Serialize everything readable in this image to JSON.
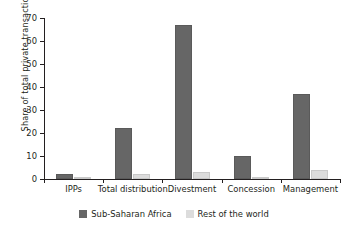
{
  "chart_data": {
    "type": "bar",
    "title": "",
    "xlabel": "",
    "ylabel": "Share of total private transactions (%)",
    "categories": [
      "IPPs",
      "Total distribution",
      "Divestment",
      "Concession",
      "Management"
    ],
    "series": [
      {
        "name": "Sub-Saharan Africa",
        "color": "#666666",
        "values": [
          2,
          22,
          67,
          10,
          37
        ]
      },
      {
        "name": "Rest of the world",
        "color": "#dcdcdc",
        "values": [
          1,
          2,
          3,
          1,
          4
        ]
      }
    ],
    "ylim": [
      0,
      70
    ],
    "yticks": [
      0,
      10,
      20,
      30,
      40,
      50,
      60,
      70
    ],
    "ytick_labels": [
      "0",
      "10",
      "20",
      "30",
      "40",
      "50",
      "60",
      "70"
    ],
    "grid": false,
    "legend_position": "bottom-center"
  }
}
